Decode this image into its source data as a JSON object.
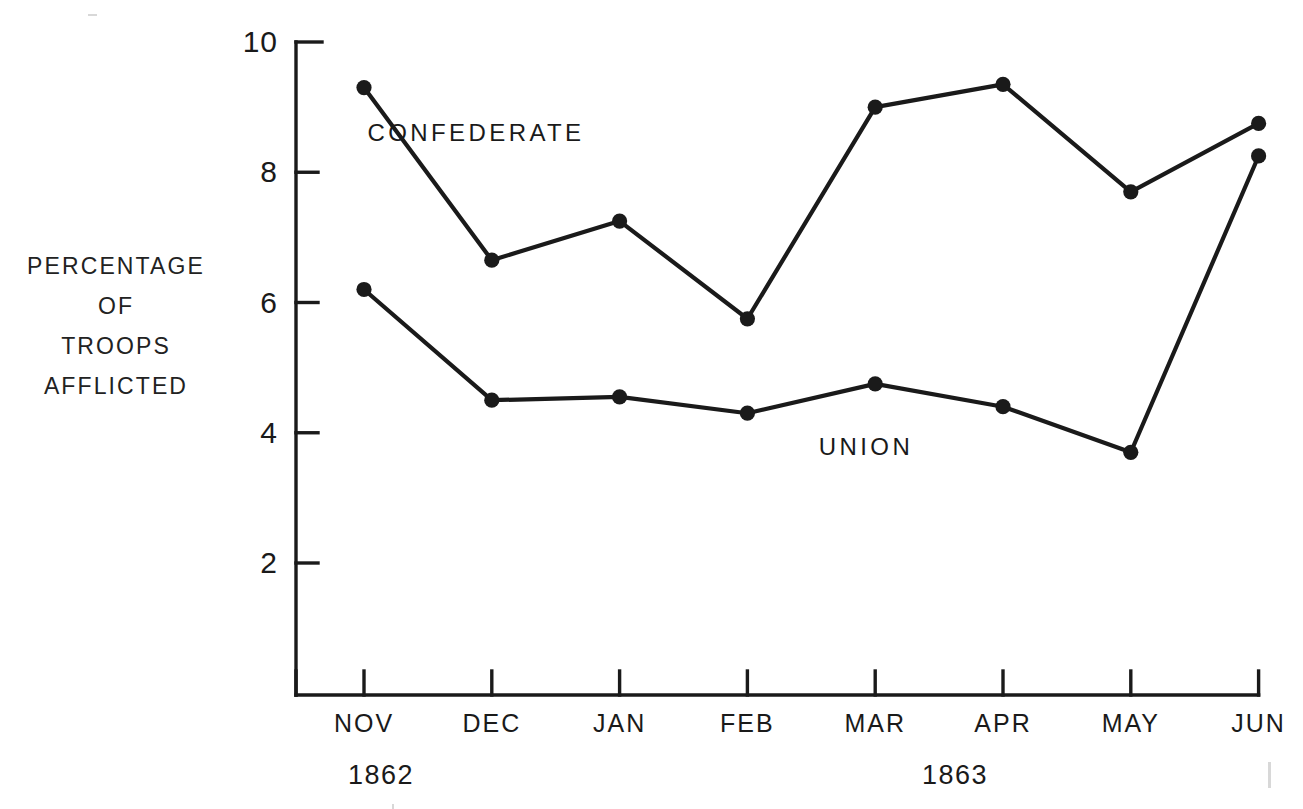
{
  "figure": {
    "y_axis_caption_lines": [
      "PERCENTAGE",
      "OF",
      "TROOPS",
      "AFFLICTED"
    ],
    "series_labels": {
      "confederate": "CONFEDERATE",
      "union": "UNION"
    },
    "year_labels": [
      {
        "text": "1862",
        "x_center_px": 381
      },
      {
        "text": "1863",
        "x_center_px": 955
      }
    ]
  },
  "chart_data": {
    "type": "line",
    "title": "",
    "xlabel": "",
    "ylabel": "PERCENTAGE OF TROOPS AFFLICTED",
    "categories": [
      "NOV",
      "DEC",
      "JAN",
      "FEB",
      "MAR",
      "APR",
      "MAY",
      "JUN"
    ],
    "category_years": [
      "1862",
      "1862",
      "1863",
      "1863",
      "1863",
      "1863",
      "1863",
      "1863"
    ],
    "ylim": [
      0,
      10
    ],
    "ytick_values": [
      10,
      8,
      6,
      4,
      2
    ],
    "ytick_labels": [
      "10",
      "8",
      "6",
      "4",
      "2"
    ],
    "grid": false,
    "legend_position": "inline-annotation",
    "marker": "filled-circle",
    "series": [
      {
        "name": "CONFEDERATE",
        "color": "#1a1a1a",
        "values": [
          9.3,
          6.65,
          7.25,
          5.75,
          9.0,
          9.35,
          7.7,
          8.75
        ]
      },
      {
        "name": "UNION",
        "color": "#1a1a1a",
        "values": [
          6.2,
          4.5,
          4.55,
          4.3,
          4.75,
          4.4,
          3.7,
          8.25
        ]
      }
    ]
  }
}
